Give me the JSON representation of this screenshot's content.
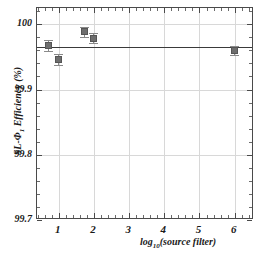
{
  "chart_data": {
    "type": "scatter",
    "title": "",
    "xlabel": "log10(source filter)",
    "xlabel_parts": {
      "head": "log",
      "sub": "10",
      "tail": "(source filter)"
    },
    "ylabel": "SL-Φ1 Efficiency (%)",
    "ylabel_parts": {
      "head": "SL-Φ",
      "sub": "1",
      "tail": " Efficiency (%)"
    },
    "xlim": [
      0.38,
      6.55
    ],
    "ylim": [
      99.7,
      100.025
    ],
    "xticks": [
      1,
      2,
      3,
      4,
      5,
      6
    ],
    "xtick_labels": [
      "1",
      "2",
      "3",
      "4",
      "5",
      "6"
    ],
    "yticks": [
      99.7,
      99.8,
      99.9,
      100.0
    ],
    "ytick_labels": [
      "99.7",
      "99.8",
      "99.9",
      "100"
    ],
    "grid": true,
    "legend": "none",
    "reference_line": {
      "y": 99.9655,
      "label": ""
    },
    "x": [
      0.7,
      1.0,
      1.72,
      2.0,
      6.0
    ],
    "values": [
      99.9675,
      99.9455,
      99.9885,
      99.9785,
      99.9605
    ],
    "yerr": [
      0.0085,
      0.0085,
      0.0075,
      0.0075,
      0.007
    ],
    "series": [
      {
        "name": "SL-Φ1 efficiency",
        "points": [
          {
            "x": 0.7,
            "y": 99.9675,
            "err": 0.0085
          },
          {
            "x": 1.0,
            "y": 99.9455,
            "err": 0.0085
          },
          {
            "x": 1.72,
            "y": 99.9885,
            "err": 0.0075
          },
          {
            "x": 2.0,
            "y": 99.9785,
            "err": 0.0075
          },
          {
            "x": 6.0,
            "y": 99.9605,
            "err": 0.007
          }
        ]
      }
    ],
    "marker": {
      "shape": "square",
      "color": "#6e6e6e",
      "edge_color": "#555555"
    },
    "errorbar_color": "#8a8a8a",
    "grid_color": "#d8d8d8",
    "frame_color": "#4a4a4a"
  }
}
